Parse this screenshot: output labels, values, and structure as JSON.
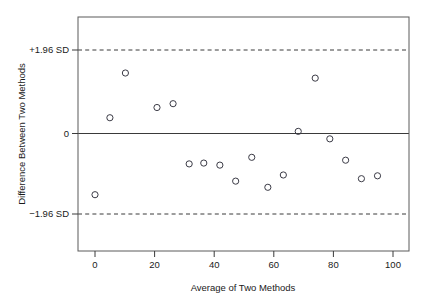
{
  "chart_data": {
    "type": "scatter",
    "title": "",
    "xlabel": "Average of Two Methods",
    "ylabel": "Difference Between Two Methods",
    "xlim": [
      -5.7,
      105.4
    ],
    "ylim": [
      -2.78,
      2.78
    ],
    "xticks": [
      0,
      20,
      40,
      60,
      80,
      100
    ],
    "xtick_labels": [
      "0",
      "20",
      "40",
      "60",
      "80",
      "100"
    ],
    "yticks": [
      1.96,
      0,
      -1.96
    ],
    "ytick_labels": [
      "+1.96 SD",
      "0",
      "−1.96 SD"
    ],
    "grid": false,
    "legend": null,
    "reference_lines": [
      {
        "name": "mean-difference",
        "y": 0,
        "style": "solid",
        "label": "0"
      },
      {
        "name": "upper-limit-of-agreement",
        "y": 1.96,
        "style": "dashed",
        "label": "+1.96 SD"
      },
      {
        "name": "lower-limit-of-agreement",
        "y": -1.96,
        "style": "dashed",
        "label": "−1.96 SD"
      }
    ],
    "marker": {
      "shape": "circle",
      "filled": false,
      "size": 3.1,
      "color": "#3b3b46"
    },
    "points": [
      {
        "x": 0.0,
        "y": -1.49
      },
      {
        "x": 5.0,
        "y": 0.37
      },
      {
        "x": 10.2,
        "y": 1.42
      },
      {
        "x": 20.8,
        "y": 0.61
      },
      {
        "x": 26.2,
        "y": 0.7
      },
      {
        "x": 31.6,
        "y": -0.74
      },
      {
        "x": 36.5,
        "y": -0.72
      },
      {
        "x": 41.9,
        "y": -0.77
      },
      {
        "x": 47.2,
        "y": -1.16
      },
      {
        "x": 52.6,
        "y": -0.58
      },
      {
        "x": 58.0,
        "y": -1.31
      },
      {
        "x": 63.2,
        "y": -1.01
      },
      {
        "x": 68.2,
        "y": 0.05
      },
      {
        "x": 73.9,
        "y": 1.3
      },
      {
        "x": 78.8,
        "y": -0.13
      },
      {
        "x": 84.1,
        "y": -0.65
      },
      {
        "x": 89.4,
        "y": -1.1
      },
      {
        "x": 94.8,
        "y": -1.03
      }
    ],
    "n_points": 18,
    "colors": {
      "axis": "#5a5a5a",
      "line": "#3a3a3a",
      "marker": "#3b3b46",
      "background": "#ffffff"
    }
  },
  "axes": {
    "x_title": "Average of Two Methods",
    "y_title": "Difference Between Two Methods",
    "x_tick_labels": [
      "0",
      "20",
      "40",
      "60",
      "80",
      "100"
    ],
    "y_tick_labels": [
      "+1.96 SD",
      "0",
      "−1.96 SD"
    ]
  }
}
